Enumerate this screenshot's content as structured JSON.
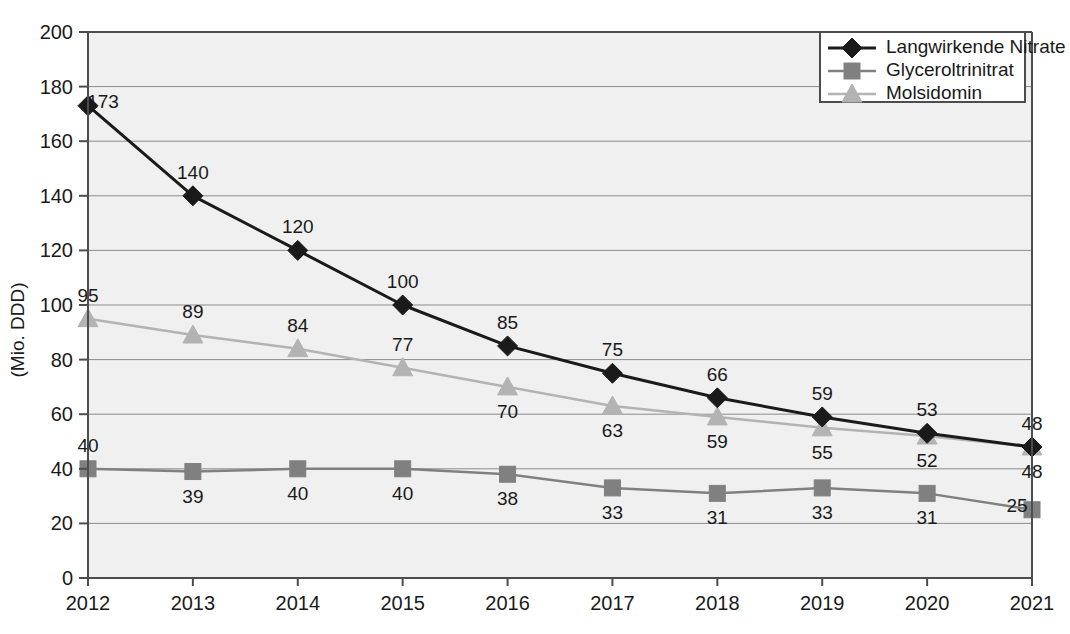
{
  "chart_data": {
    "type": "line",
    "title": "",
    "xlabel": "",
    "ylabel": "(Mio. DDD)",
    "categories": [
      "2012",
      "2013",
      "2014",
      "2015",
      "2016",
      "2017",
      "2018",
      "2019",
      "2020",
      "2021"
    ],
    "x": [
      2012,
      2013,
      2014,
      2015,
      2016,
      2017,
      2018,
      2019,
      2020,
      2021
    ],
    "ylim": [
      0,
      200
    ],
    "xlim": [
      2012,
      2021
    ],
    "yticks": [
      0,
      20,
      40,
      60,
      80,
      100,
      120,
      140,
      160,
      180,
      200
    ],
    "ytick_labels": [
      "0",
      "20",
      "40",
      "60",
      "80",
      "100",
      "120",
      "140",
      "160",
      "180",
      "200"
    ],
    "grid": true,
    "grid_axis": "y",
    "legend_position": "top-right",
    "series": [
      {
        "name": "Langwirkende Nitrate",
        "marker": "diamond",
        "color": "#1a1a1a",
        "line_color": "#1a1a1a",
        "values": [
          173,
          140,
          120,
          100,
          85,
          75,
          66,
          59,
          53,
          48
        ],
        "labels": [
          "173",
          "140",
          "120",
          "100",
          "85",
          "75",
          "66",
          "59",
          "53",
          "48"
        ],
        "label_side": [
          "right",
          "above",
          "above",
          "above",
          "above",
          "above",
          "above",
          "above",
          "above",
          "above"
        ]
      },
      {
        "name": "Glyceroltrinitrat",
        "marker": "square",
        "color": "#808080",
        "line_color": "#808080",
        "values": [
          40,
          39,
          40,
          40,
          38,
          33,
          31,
          33,
          31,
          25
        ],
        "labels": [
          "40",
          "39",
          "40",
          "40",
          "38",
          "33",
          "31",
          "33",
          "31",
          "25"
        ],
        "label_side": [
          "above",
          "below",
          "below",
          "below",
          "below",
          "below",
          "below",
          "below",
          "below",
          "left"
        ]
      },
      {
        "name": "Molsidomin",
        "marker": "triangle",
        "color": "#b3b3b3",
        "line_color": "#b3b3b3",
        "values": [
          95,
          89,
          84,
          77,
          70,
          63,
          59,
          55,
          52,
          48
        ],
        "labels": [
          "95",
          "89",
          "84",
          "77",
          "70",
          "63",
          "59",
          "55",
          "52",
          "48"
        ],
        "label_side": [
          "above",
          "above",
          "above",
          "above",
          "below",
          "below",
          "below",
          "below",
          "below",
          "below"
        ]
      }
    ]
  },
  "legend": {
    "items": [
      {
        "label": "Langwirkende Nitrate",
        "marker": "diamond-icon",
        "color": "#1a1a1a"
      },
      {
        "label": "Glyceroltrinitrat",
        "marker": "square-icon",
        "color": "#808080"
      },
      {
        "label": "Molsidomin",
        "marker": "triangle-icon",
        "color": "#b3b3b3"
      }
    ]
  },
  "colors": {
    "plot_background": "#f0f0f0",
    "gridline": "#8c8c8c",
    "axis": "#4d4d4d",
    "text": "#1a1a1a",
    "series_nitrate": "#1a1a1a",
    "series_glyceroltrinitrat": "#808080",
    "series_molsidomin": "#b3b3b3"
  }
}
